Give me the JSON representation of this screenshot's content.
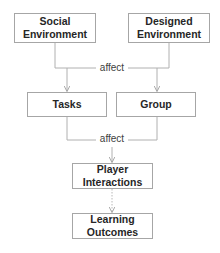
{
  "diagram": {
    "type": "flowchart",
    "nodes": [
      {
        "id": "social",
        "lines": [
          "Social",
          "Environment"
        ]
      },
      {
        "id": "designed",
        "lines": [
          "Designed",
          "Environment"
        ]
      },
      {
        "id": "tasks",
        "lines": [
          "Tasks"
        ]
      },
      {
        "id": "group",
        "lines": [
          "Group"
        ]
      },
      {
        "id": "player",
        "lines": [
          "Player",
          "Interactions"
        ]
      },
      {
        "id": "learning",
        "lines": [
          "Learning",
          "Outcomes"
        ]
      }
    ],
    "edge_labels": {
      "top": "affect",
      "middle": "affect"
    },
    "edges": [
      {
        "from": [
          "social",
          "designed"
        ],
        "to": [
          "tasks",
          "group"
        ],
        "label": "affect",
        "style": "solid"
      },
      {
        "from": [
          "tasks",
          "group"
        ],
        "to": [
          "player"
        ],
        "label": "affect",
        "style": "solid"
      },
      {
        "from": [
          "player"
        ],
        "to": [
          "learning"
        ],
        "style": "dotted"
      }
    ],
    "colors": {
      "box_border": "#a6a6a6",
      "connector": "#b0b0b0",
      "text": "#262626"
    }
  }
}
